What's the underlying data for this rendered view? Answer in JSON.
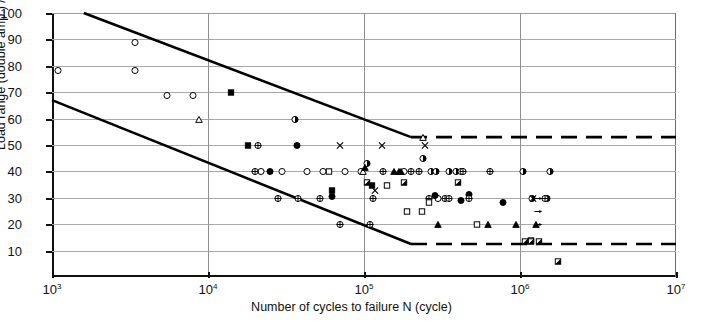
{
  "chart_data": {
    "type": "scatter",
    "title": "",
    "xlabel": "Number of cycles to failure N (cycle)",
    "ylabel": "Load range (double amp.) / Breaking strength (%)",
    "xscale": "log",
    "yscale": "linear",
    "xlim": [
      1000,
      10000000
    ],
    "ylim": [
      0,
      100
    ],
    "grid": true,
    "legend": "none",
    "x_ticks": [
      {
        "value": 1000,
        "label": "10",
        "exponent": "3"
      },
      {
        "value": 10000,
        "label": "10",
        "exponent": "4"
      },
      {
        "value": 100000,
        "label": "10",
        "exponent": "5"
      },
      {
        "value": 1000000,
        "label": "10",
        "exponent": "6"
      },
      {
        "value": 10000000,
        "label": "10",
        "exponent": "7"
      }
    ],
    "y_ticks": [
      {
        "value": 100,
        "label": "100"
      },
      {
        "value": 90,
        "label": "90"
      },
      {
        "value": 80,
        "label": "80"
      },
      {
        "value": 70,
        "label": "70"
      },
      {
        "value": 60,
        "label": "60"
      },
      {
        "value": 50,
        "label": "50"
      },
      {
        "value": 40,
        "label": "40"
      },
      {
        "value": 30,
        "label": "30"
      },
      {
        "value": 20,
        "label": "20"
      },
      {
        "value": 10,
        "label": "10"
      }
    ],
    "boundary_lines": [
      {
        "name": "upper-bound",
        "color": "#000000",
        "width": 2.6,
        "solid": [
          [
            1600,
            100
          ],
          [
            200000,
            53
          ]
        ],
        "dashed": [
          [
            200000,
            53
          ],
          [
            10000000,
            53
          ]
        ]
      },
      {
        "name": "lower-bound",
        "color": "#000000",
        "width": 2.6,
        "solid": [
          [
            1000,
            67
          ],
          [
            200000,
            12.5
          ]
        ],
        "dashed": [
          [
            200000,
            12.5
          ],
          [
            10000000,
            12.5
          ]
        ]
      }
    ],
    "series": [
      {
        "name": "open-circle",
        "marker": "circle-open",
        "points": [
          [
            1100,
            78.5
          ],
          [
            3400,
            89
          ],
          [
            3400,
            78.5
          ],
          [
            5500,
            69
          ],
          [
            8000,
            69
          ],
          [
            22000,
            40
          ],
          [
            30000,
            40
          ],
          [
            43000,
            40
          ],
          [
            55000,
            40
          ],
          [
            76000,
            40
          ],
          [
            95000,
            40
          ],
          [
            180000,
            40
          ],
          [
            300000,
            30
          ]
        ]
      },
      {
        "name": "filled-circle",
        "marker": "circle-filled",
        "points": [
          [
            37000,
            50
          ],
          [
            25000,
            40
          ],
          [
            62000,
            30.5
          ],
          [
            285000,
            31
          ],
          [
            420000,
            29
          ],
          [
            470000,
            31.5
          ],
          [
            780000,
            28.5
          ]
        ]
      },
      {
        "name": "half-filled-circle",
        "marker": "circle-half",
        "points": [
          [
            36000,
            60
          ],
          [
            104000,
            43
          ],
          [
            240000,
            45
          ],
          [
            350000,
            40
          ],
          [
            390000,
            40
          ],
          [
            420000,
            40
          ],
          [
            270000,
            40
          ],
          [
            290000,
            40
          ],
          [
            1200000,
            30
          ],
          [
            1500000,
            30
          ],
          [
            1550000,
            40
          ],
          [
            1050000,
            40
          ]
        ]
      },
      {
        "name": "crossed-circle",
        "marker": "circle-cross",
        "points": [
          [
            21000,
            50
          ],
          [
            20000,
            40
          ],
          [
            28000,
            30
          ],
          [
            38000,
            30
          ],
          [
            52000,
            30
          ],
          [
            115000,
            30
          ],
          [
            132000,
            40
          ],
          [
            200000,
            40
          ],
          [
            225000,
            40
          ],
          [
            260000,
            30
          ],
          [
            330000,
            30
          ],
          [
            350000,
            30
          ],
          [
            430000,
            40
          ],
          [
            470000,
            30
          ],
          [
            640000,
            40
          ],
          [
            70000,
            20
          ],
          [
            110000,
            20
          ],
          [
            1450000,
            30
          ]
        ]
      },
      {
        "name": "open-square",
        "marker": "square-open",
        "points": [
          [
            60000,
            40
          ],
          [
            190000,
            25
          ],
          [
            235000,
            25
          ],
          [
            260000,
            28.5
          ],
          [
            530000,
            20
          ],
          [
            1180000,
            14
          ],
          [
            140000,
            35
          ]
        ]
      },
      {
        "name": "filled-square",
        "marker": "square-filled",
        "points": [
          [
            14000,
            70
          ],
          [
            18000,
            50
          ],
          [
            62000,
            33
          ],
          [
            112000,
            35
          ]
        ]
      },
      {
        "name": "half-square",
        "marker": "square-half",
        "points": [
          [
            105000,
            36
          ],
          [
            180000,
            36
          ],
          [
            400000,
            36
          ],
          [
            1330000,
            13.5
          ],
          [
            1180000,
            13.5
          ],
          [
            1080000,
            13.5
          ],
          [
            1750000,
            6
          ]
        ]
      },
      {
        "name": "open-triangle",
        "marker": "triangle-open",
        "points": [
          [
            8700,
            60
          ],
          [
            98000,
            40
          ],
          [
            240000,
            53
          ]
        ]
      },
      {
        "name": "filled-triangle",
        "marker": "triangle-filled",
        "points": [
          [
            102000,
            41.5
          ],
          [
            155000,
            40
          ],
          [
            168000,
            40
          ],
          [
            172000,
            40
          ],
          [
            300000,
            20
          ],
          [
            620000,
            20
          ],
          [
            940000,
            20
          ],
          [
            1270000,
            20
          ]
        ]
      },
      {
        "name": "x-mark",
        "marker": "x",
        "points": [
          [
            70000,
            50
          ],
          [
            130000,
            50
          ],
          [
            245000,
            50
          ],
          [
            118000,
            33
          ],
          [
            1220000,
            30
          ]
        ]
      },
      {
        "name": "runout-arrow",
        "marker": "arrow-right",
        "points": [
          [
            1300000,
            30
          ],
          [
            1300000,
            25
          ],
          [
            1300000,
            20
          ]
        ]
      }
    ]
  },
  "axes": {
    "x_title": "Number of cycles to failure N (cycle)",
    "y_title": "Load range (double amp.) / Breaking strength (%)"
  }
}
